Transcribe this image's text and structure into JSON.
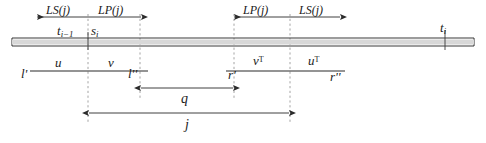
{
  "figure": {
    "type": "timeline-interval-diagram",
    "width": 486,
    "height": 143,
    "background": "#ffffff",
    "ink": "#2b2b2b",
    "dash_color": "#9a9a9a"
  },
  "top_measures": {
    "left_group": {
      "left_label": "LS(j)",
      "right_label": "LP(j)"
    },
    "right_group": {
      "left_label": "LP(j)",
      "right_label": "LS(j)"
    }
  },
  "axis_labels": {
    "t_prev": "t",
    "t_prev_sub": "i−1",
    "s_cur": "s",
    "s_cur_sub": "i",
    "t_end": "t",
    "t_end_sub": "i"
  },
  "segments": {
    "u": "u",
    "v": "v",
    "v_transpose": "v",
    "v_transpose_sup": "T",
    "u_transpose": "u",
    "u_transpose_sup": "T"
  },
  "endpoints": {
    "l_prime": "l'",
    "l_double_prime": "l''",
    "r_prime": "r'",
    "r_double_prime": "r''"
  },
  "spans": {
    "q": "q",
    "j": "j"
  },
  "geometry": {
    "tube": {
      "x1": 12,
      "x2": 474,
      "y": 42,
      "half_height": 4
    },
    "dashed_x": [
      88,
      140,
      234,
      290
    ],
    "dashed_y1": 14,
    "dashed_y2": 122,
    "tick_x": 445,
    "top_arrow_y": 17,
    "top_left_arrow": {
      "x1": 37,
      "x2": 141
    },
    "top_right_arrow": {
      "x1": 234,
      "x2": 340
    },
    "seg_line_y": 71,
    "seg_left": {
      "x1": 30,
      "x2": 148
    },
    "seg_right": {
      "x1": 226,
      "x2": 345
    },
    "q_arrow": {
      "x1": 140,
      "x2": 234,
      "y": 88
    },
    "j_arrow": {
      "x1": 88,
      "x2": 290,
      "y": 113
    }
  }
}
